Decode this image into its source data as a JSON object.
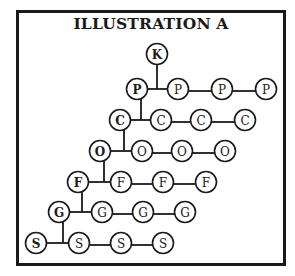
{
  "title": "ILLUSTRATION A",
  "root": {
    "label": "K"
  },
  "rows": [
    {
      "label": "P",
      "count": 4
    },
    {
      "label": "C",
      "count": 4
    },
    {
      "label": "O",
      "count": 4
    },
    {
      "label": "F",
      "count": 4
    },
    {
      "label": "G",
      "count": 4
    },
    {
      "label": "S",
      "count": 4
    }
  ],
  "colors": {
    "ink": "#1a1a1a",
    "background": "#ffffff"
  }
}
